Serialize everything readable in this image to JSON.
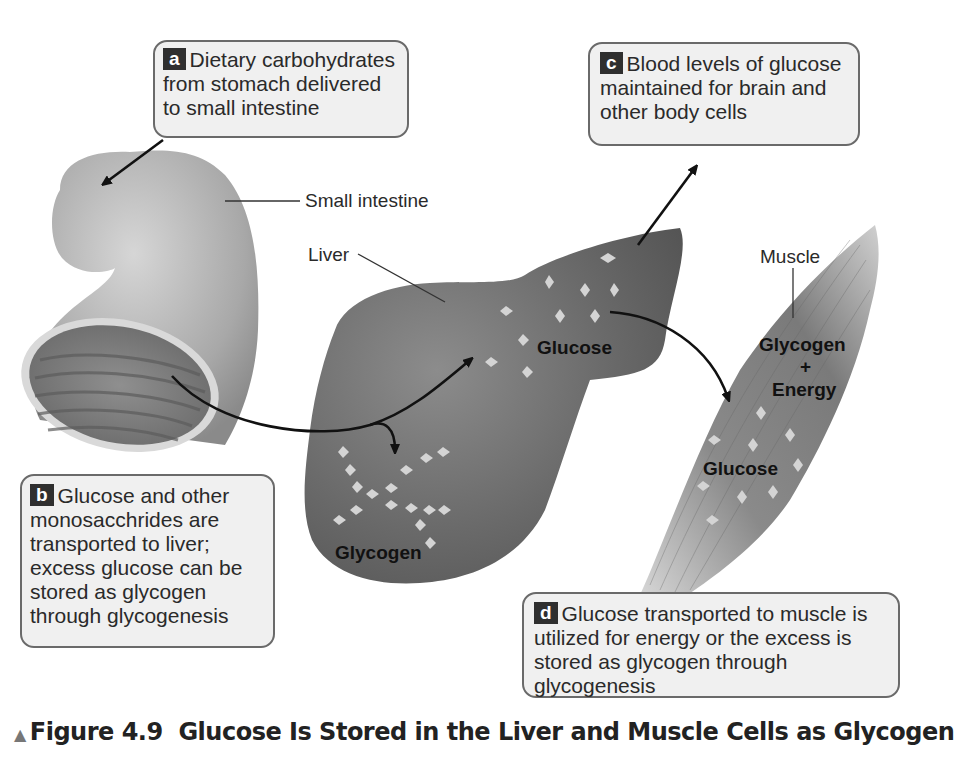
{
  "figure": {
    "caption_marker": "▲",
    "caption_number": "Figure 4.9",
    "caption_title": "Glucose Is Stored in the Liver and Muscle Cells as Glycogen"
  },
  "callouts": [
    {
      "id": "a",
      "badge": "a",
      "lines": [
        "Dietary carbohydrates",
        "from stomach delivered",
        "to small intestine"
      ]
    },
    {
      "id": "b",
      "badge": "b",
      "lines": [
        "Glucose and other",
        "monosacchrides are",
        "transported to liver;",
        "excess glucose can be",
        "stored as glycogen",
        "through glycogenesis"
      ]
    },
    {
      "id": "c",
      "badge": "c",
      "lines": [
        "Blood levels of glucose",
        "maintained for brain and",
        "other body cells"
      ]
    },
    {
      "id": "d",
      "badge": "d",
      "lines": [
        "Glucose transported to muscle is",
        "utilized for energy or the excess is",
        "stored as glycogen through",
        "glycogenesis"
      ]
    }
  ],
  "organ_labels": {
    "small_intestine": "Small intestine",
    "liver": "Liver",
    "muscle": "Muscle"
  },
  "liver_labels": {
    "glucose": "Glucose",
    "glycogen": "Glycogen"
  },
  "muscle_labels": {
    "glycogen": "Glycogen",
    "plus": "+",
    "energy": "Energy",
    "glucose": "Glucose"
  },
  "colors": {
    "callout_bg": "#f0f0f0",
    "callout_border": "#6a6a6a",
    "badge_bg": "#2f2f2f",
    "organ_dark": "#6e6e6e",
    "organ_light": "#bdbdbd",
    "glucose_molecule": "#d4d4d4"
  }
}
